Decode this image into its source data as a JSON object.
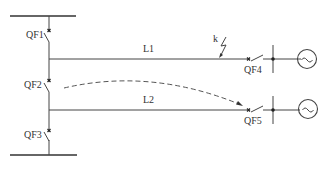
{
  "diagram": {
    "type": "single-line power system diagram",
    "colors": {
      "line": "#444444",
      "background": "#ffffff",
      "text": "#333333"
    },
    "breakers": {
      "qf1": "QF1",
      "qf2": "QF2",
      "qf3": "QF3",
      "qf4": "QF4",
      "qf5": "QF5"
    },
    "lines": {
      "l1": "L1",
      "l2": "L2"
    },
    "fault_label": "k",
    "generator_symbol": "~"
  }
}
